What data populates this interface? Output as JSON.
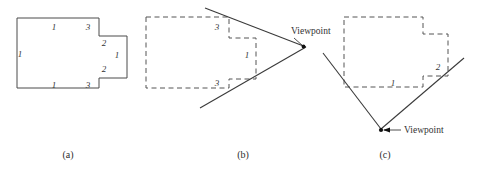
{
  "figure": {
    "panels": [
      {
        "id": "a",
        "caption": "(a)",
        "caption_x": 68,
        "caption_y": 158,
        "description": "solid outline polygon with right-side notch",
        "edge_labels": [
          {
            "text": "1",
            "x": 54,
            "y": 30
          },
          {
            "text": "3",
            "x": 88,
            "y": 30
          },
          {
            "text": "2",
            "x": 104,
            "y": 46
          },
          {
            "text": "1",
            "x": 117,
            "y": 58
          },
          {
            "text": "2",
            "x": 104,
            "y": 72
          },
          {
            "text": "1",
            "x": 20,
            "y": 57
          },
          {
            "text": "1",
            "x": 54,
            "y": 88
          },
          {
            "text": "3",
            "x": 88,
            "y": 88
          }
        ]
      },
      {
        "id": "b",
        "caption": "(b)",
        "caption_x": 243,
        "caption_y": 158,
        "description": "dashed polygon with two view rays converging at viewpoint on the right",
        "edge_labels": [
          {
            "text": "3",
            "x": 217,
            "y": 30
          },
          {
            "text": "1",
            "x": 247,
            "y": 58
          },
          {
            "text": "3",
            "x": 217,
            "y": 86
          }
        ],
        "viewpoint": {
          "label": "Viewpoint",
          "dot_x": 303,
          "dot_y": 47,
          "label_x": 291,
          "label_y": 34
        }
      },
      {
        "id": "c",
        "caption": "(c)",
        "caption_x": 385,
        "caption_y": 158,
        "description": "dashed polygon with two view rays converging at viewpoint below",
        "edge_labels": [
          {
            "text": "1",
            "x": 393,
            "y": 86
          },
          {
            "text": "2",
            "x": 438,
            "y": 70
          }
        ],
        "viewpoint": {
          "label": "Viewpoint",
          "dot_x": 381,
          "dot_y": 130,
          "label_x": 404,
          "label_y": 133
        }
      }
    ],
    "colors": {
      "solid_stroke": "#4a4a4a",
      "dashed_stroke": "#555555",
      "ray_stroke": "#3a3a3a",
      "text": "#333333",
      "background": "#ffffff"
    }
  }
}
